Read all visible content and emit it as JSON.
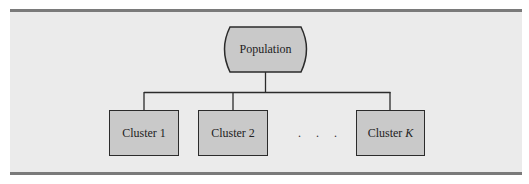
{
  "diagram": {
    "type": "cluster-sampling-tree",
    "root": {
      "label": "Population",
      "shape": "terminal"
    },
    "children": [
      {
        "label": "Cluster 1"
      },
      {
        "label": "Cluster 2"
      },
      {
        "label": "Cluster ",
        "label_italic": "K"
      }
    ],
    "ellipsis": ". . .",
    "colors": {
      "panel_background": "#ebebeb",
      "node_fill": "#c9c9c9",
      "node_stroke": "#2b2b2b",
      "connector": "#2b2b2b",
      "rule": "#7a7a7a"
    }
  }
}
